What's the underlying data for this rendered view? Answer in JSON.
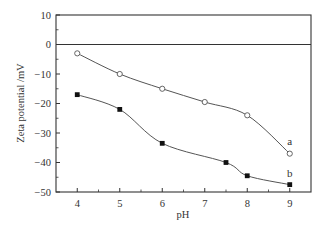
{
  "chart_data": {
    "type": "line",
    "title": "",
    "xlabel": "pH",
    "ylabel": "Zeta potential /mV",
    "xlim": [
      3.5,
      9.5
    ],
    "ylim": [
      -50,
      10
    ],
    "xticks": [
      4,
      5,
      6,
      7,
      8,
      9
    ],
    "yticks": [
      10,
      0,
      -10,
      -20,
      -30,
      -40,
      -50
    ],
    "grid": false,
    "zero_line": true,
    "legend": "inline labels",
    "series": [
      {
        "name": "a",
        "marker": "open-circle",
        "x": [
          4,
          5,
          6,
          7,
          8,
          9
        ],
        "y": [
          -3,
          -10,
          -15,
          -19.5,
          -24,
          -37
        ]
      },
      {
        "name": "b",
        "marker": "filled-square",
        "x": [
          4,
          5,
          6,
          7.5,
          8,
          9
        ],
        "y": [
          -17,
          -22,
          -33.5,
          -40,
          -44.5,
          -47.5
        ]
      }
    ],
    "colors": {
      "line": "#555555",
      "axis": "#333333"
    }
  }
}
